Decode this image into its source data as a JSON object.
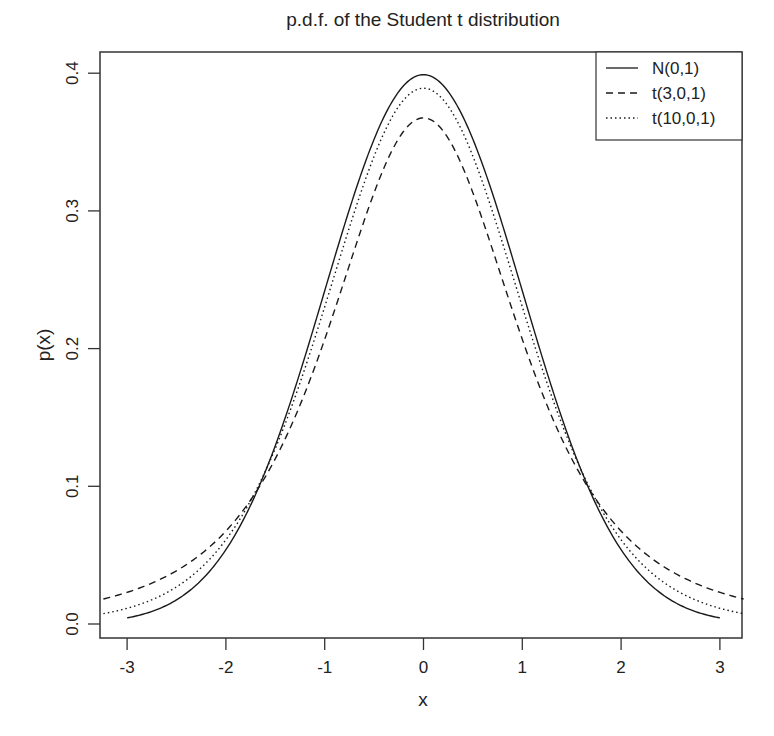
{
  "chart_data": {
    "type": "line",
    "title": "p.d.f. of the Student t distribution",
    "xlabel": "x",
    "ylabel": "p(x)",
    "xlim": [
      -3.24,
      3.24
    ],
    "ylim": [
      -0.01,
      0.415
    ],
    "x_ticks": [
      "-3",
      "-2",
      "-1",
      "0",
      "1",
      "2",
      "3"
    ],
    "x_tick_values": [
      -3,
      -2,
      -1,
      0,
      1,
      2,
      3
    ],
    "y_ticks": [
      "0.0",
      "0.1",
      "0.2",
      "0.3",
      "0.4"
    ],
    "y_tick_values": [
      0.0,
      0.1,
      0.2,
      0.3,
      0.4
    ],
    "grid": false,
    "legend_position": "top-right",
    "x": [
      -3.0,
      -2.5,
      -2.0,
      -1.5,
      -1.0,
      -0.5,
      0.0,
      0.5,
      1.0,
      1.5,
      2.0,
      2.5,
      3.0
    ],
    "series": [
      {
        "name": "N(0,1)",
        "dist": "normal",
        "df": null,
        "line_style": "solid",
        "x_range": [
          -3,
          3
        ],
        "values": [
          0.0044,
          0.0175,
          0.054,
          0.1295,
          0.242,
          0.3521,
          0.3989,
          0.3521,
          0.242,
          0.1295,
          0.054,
          0.0175,
          0.0044
        ]
      },
      {
        "name": "t(3,0,1)",
        "dist": "t",
        "df": 3,
        "line_style": "dashed",
        "x_range": [
          -3.24,
          3.24
        ],
        "values": [
          0.023,
          0.0375,
          0.0675,
          0.1274,
          0.2067,
          0.3183,
          0.3676,
          0.3183,
          0.2067,
          0.1274,
          0.0675,
          0.0375,
          0.023
        ]
      },
      {
        "name": "t(10,0,1)",
        "dist": "t",
        "df": 10,
        "line_style": "dotted",
        "x_range": [
          -3.24,
          3.24
        ],
        "values": [
          0.0114,
          0.0269,
          0.0611,
          0.1274,
          0.2304,
          0.3397,
          0.3891,
          0.3397,
          0.2304,
          0.1274,
          0.0611,
          0.0269,
          0.0114
        ]
      }
    ]
  },
  "colors": {
    "line": "#1a1a1a",
    "axis": "#333333",
    "background": "#ffffff"
  }
}
